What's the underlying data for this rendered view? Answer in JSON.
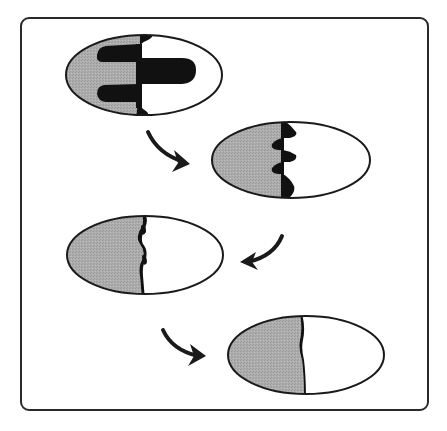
{
  "diagram": {
    "type": "sequence",
    "colors": {
      "outline": "#1a1a1a",
      "gray_fill": "#a9a9a9",
      "white_fill": "#ffffff",
      "black_fill": "#111111",
      "arrow": "#1a1a1a",
      "frame": "#2a2a2a"
    },
    "frame": {
      "x": 20,
      "y": 17,
      "width": 409,
      "height": 394,
      "corner_radius": 9
    },
    "stages": [
      {
        "index": 1,
        "cx": 144,
        "cy": 75,
        "rx": 78,
        "ry": 40,
        "divider_x": 140,
        "interface": "large black fingers: two on gray side (top & bottom), one long finger into white side (middle)"
      },
      {
        "index": 2,
        "cx": 291,
        "cy": 160,
        "rx": 79,
        "ry": 38,
        "divider_x": 283,
        "interface": "alternating small black lobes along divider (5 bumps)"
      },
      {
        "index": 3,
        "cx": 145,
        "cy": 255,
        "rx": 78,
        "ry": 39,
        "divider_x": 141,
        "interface": "thin wavy black line with small bumps"
      },
      {
        "index": 4,
        "cx": 306,
        "cy": 355,
        "rx": 78,
        "ry": 39,
        "divider_x": 301,
        "interface": "nearly straight thin black boundary"
      }
    ],
    "arrows": [
      {
        "from": 1,
        "to": 2,
        "direction": "down-right",
        "x": 148,
        "y": 130
      },
      {
        "from": 2,
        "to": 3,
        "direction": "down-left",
        "x": 240,
        "y": 235
      },
      {
        "from": 3,
        "to": 4,
        "direction": "down-right",
        "x": 162,
        "y": 330
      }
    ]
  }
}
